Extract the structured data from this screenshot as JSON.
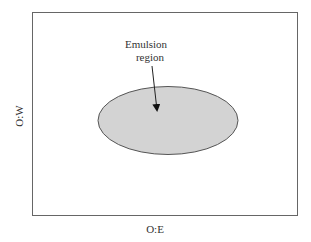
{
  "diagram": {
    "x_axis_label": "O:E",
    "y_axis_label": "O:W",
    "annotation": {
      "line1": "Emulsion",
      "line2": "region"
    },
    "region": {
      "name": "Emulsion region",
      "shape": "ellipse",
      "fill": "#d3d3d3",
      "stroke": "#555555"
    },
    "frame_color": "#666666"
  }
}
